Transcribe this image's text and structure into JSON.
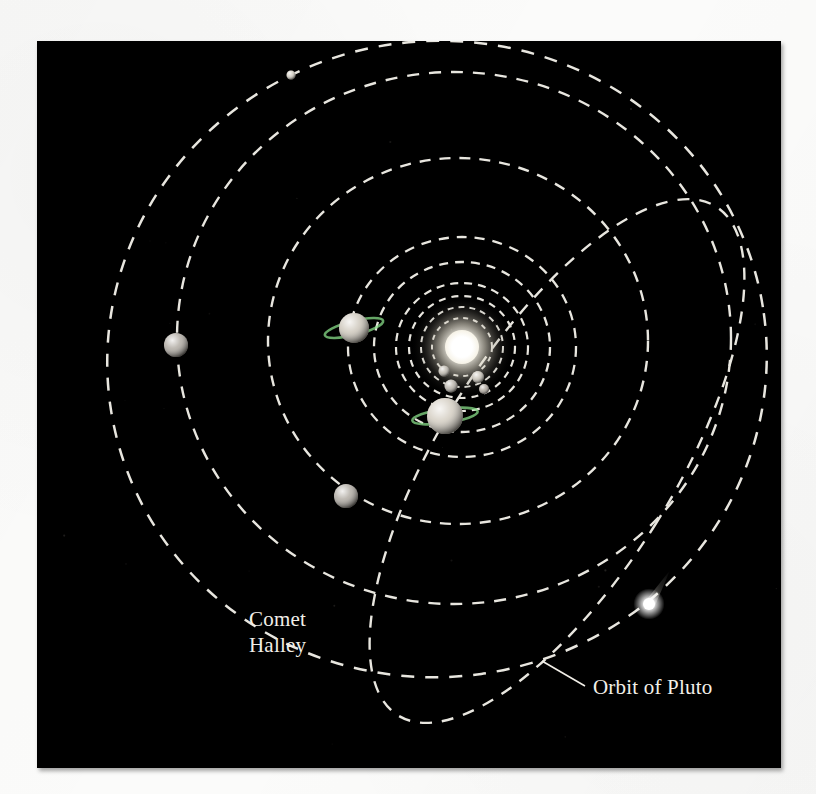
{
  "figure": {
    "kind": "solar-system-orbit-diagram",
    "background_color": "#000000",
    "page_color": "#fbfbfa",
    "orbit_color": "#e8e6df",
    "label_color": "#f2efe8",
    "plate": {
      "x": 37,
      "y": 41,
      "width": 744,
      "height": 727
    }
  },
  "labels": [
    {
      "id": "comet-halley",
      "line1": "Comet",
      "line2": "Halley",
      "x": 212,
      "y": 585
    },
    {
      "id": "orbit-of-pluto",
      "text": "Orbit of Pluto",
      "x": 556,
      "y": 653
    }
  ],
  "leader_lines": [
    {
      "id": "pluto-leader",
      "from_x": 548,
      "to_x": 505,
      "from_y": 645,
      "to_y": 620
    }
  ],
  "sun": {
    "name": "Sun",
    "cx": 425,
    "cy": 306,
    "core_radius": 17,
    "glow_radius": 52,
    "color": "#ffffff"
  },
  "planets": [
    {
      "name": "Mercury",
      "cx": 407,
      "cy": 330,
      "r": 5.5,
      "color": "#b9b3a8",
      "ring": false
    },
    {
      "name": "Venus",
      "cx": 441,
      "cy": 336,
      "r": 6.0,
      "color": "#c2bcb0",
      "ring": false
    },
    {
      "name": "Earth",
      "cx": 414,
      "cy": 345,
      "r": 6.5,
      "color": "#b4aea4",
      "ring": false
    },
    {
      "name": "Mars",
      "cx": 447,
      "cy": 348,
      "r": 5.0,
      "color": "#a79f95",
      "ring": false
    },
    {
      "name": "Jupiter",
      "cx": 408,
      "cy": 375,
      "r": 18,
      "color": "#cfc8bb",
      "ring": true,
      "ring_rx": 33,
      "ring_ry": 7,
      "ring_tilt": -8
    },
    {
      "name": "Saturn",
      "cx": 317,
      "cy": 287,
      "r": 15,
      "color": "#c8c1b4",
      "ring": true,
      "ring_rx": 30,
      "ring_ry": 7,
      "ring_tilt": -14
    },
    {
      "name": "Uranus",
      "cx": 139,
      "cy": 304,
      "r": 12,
      "color": "#a8a299",
      "ring": false
    },
    {
      "name": "Neptune",
      "cx": 309,
      "cy": 455,
      "r": 12,
      "color": "#a8a299",
      "ring": false
    },
    {
      "name": "Pluto",
      "cx": 254,
      "cy": 34,
      "r": 4.5,
      "color": "#cdc7bb",
      "ring": false
    }
  ],
  "comet": {
    "name": "Comet Halley",
    "cx": 612,
    "cy": 563,
    "nucleus_radius": 6,
    "tail_angle_deg": -58,
    "tail_length": 40,
    "color": "#ffffff"
  },
  "orbits": [
    {
      "name": "Mercury orbit",
      "cx": 425,
      "cy": 306,
      "rx": 30,
      "ry": 29,
      "rotate": 0,
      "dash": "5 5",
      "width": 2.0
    },
    {
      "name": "Venus orbit",
      "cx": 425,
      "cy": 306,
      "rx": 41,
      "ry": 40,
      "rotate": 0,
      "dash": "6 5",
      "width": 2.0
    },
    {
      "name": "Earth orbit",
      "cx": 425,
      "cy": 306,
      "rx": 53,
      "ry": 51,
      "rotate": 0,
      "dash": "7 6",
      "width": 2.2
    },
    {
      "name": "Mars orbit",
      "cx": 425,
      "cy": 306,
      "rx": 66,
      "ry": 64,
      "rotate": 0,
      "dash": "8 6",
      "width": 2.2
    },
    {
      "name": "Jupiter orbit",
      "cx": 425,
      "cy": 306,
      "rx": 88,
      "ry": 85,
      "rotate": 0,
      "dash": "9 7",
      "width": 2.3
    },
    {
      "name": "Saturn orbit",
      "cx": 425,
      "cy": 306,
      "rx": 114,
      "ry": 110,
      "rotate": 0,
      "dash": "10 8",
      "width": 2.3
    },
    {
      "name": "Uranus orbit",
      "cx": 421,
      "cy": 300,
      "rx": 190,
      "ry": 183,
      "rotate": 0,
      "dash": "11 9",
      "width": 2.4
    },
    {
      "name": "Neptune orbit",
      "cx": 417,
      "cy": 297,
      "rx": 277,
      "ry": 266,
      "rotate": 0,
      "dash": "12 10",
      "width": 2.4
    },
    {
      "name": "Pluto orbit",
      "cx": 400,
      "cy": 318,
      "rx": 330,
      "ry": 318,
      "rotate": -8,
      "dash": "13 11",
      "width": 2.5
    }
  ],
  "comet_orbit": {
    "name": "Comet Halley orbit",
    "cx": 520,
    "cy": 420,
    "rx": 117,
    "ry": 300,
    "rotate": 32,
    "dash": "12 10",
    "width": 2.4
  },
  "starfield_count": 26
}
